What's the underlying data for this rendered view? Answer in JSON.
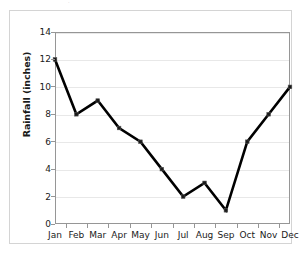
{
  "chart_data": {
    "type": "line",
    "title": "",
    "xlabel": "",
    "ylabel": "Rainfall (inches)",
    "categories": [
      "Jan",
      "Feb",
      "Mar",
      "Apr",
      "May",
      "Jun",
      "Jul",
      "Aug",
      "Sep",
      "Oct",
      "Nov",
      "Dec"
    ],
    "values": [
      12,
      8,
      9,
      7,
      6,
      4,
      2,
      3,
      1,
      6,
      8,
      10
    ],
    "series": [
      {
        "name": "Rainfall",
        "values": [
          12,
          8,
          9,
          7,
          6,
          4,
          2,
          3,
          1,
          6,
          8,
          10
        ]
      }
    ],
    "ylim": [
      0,
      14
    ],
    "ytick_step": 2,
    "ytick_labels": [
      "0",
      "2",
      "4",
      "6",
      "8",
      "10",
      "12",
      "14"
    ],
    "xtick_labels": [
      "Jan",
      "Feb",
      "Mar",
      "Apr",
      "May",
      "Jun",
      "Jul",
      "Aug",
      "Sep",
      "Oct",
      "Nov",
      "Dec"
    ],
    "grid": "horizontal",
    "legend": "none",
    "line_color": "#000000",
    "marker": "square",
    "marker_color": "#1a1a1a",
    "gridline_color": "#e8e8e8",
    "plot_border_color": "#969696",
    "frame_border_color": "#d4d4d4",
    "background_color": "#ffffff"
  },
  "title_remnant": "·"
}
